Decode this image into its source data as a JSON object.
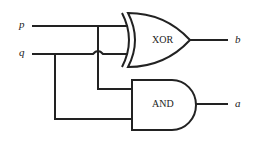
{
  "diagram": {
    "type": "logic-circuit",
    "inputs": [
      {
        "id": "p",
        "label": "p"
      },
      {
        "id": "q",
        "label": "q"
      }
    ],
    "gates": [
      {
        "id": "xor",
        "label": "XOR",
        "inputs": [
          "p",
          "q"
        ],
        "output": "b"
      },
      {
        "id": "and",
        "label": "AND",
        "inputs": [
          "p",
          "q"
        ],
        "output": "a"
      }
    ],
    "outputs": [
      {
        "id": "b",
        "label": "b"
      },
      {
        "id": "a",
        "label": "a"
      }
    ]
  }
}
